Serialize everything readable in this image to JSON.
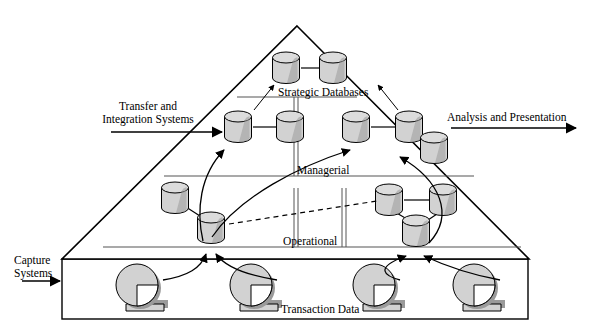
{
  "diagram": {
    "external_labels": {
      "capture_systems": "Capture\nSystems",
      "capture_systems_line1": "Capture",
      "capture_systems_line2": "Systems",
      "transfer_integration_line1": "Transfer and",
      "transfer_integration_line2": "Integration Systems",
      "analysis_presentation": "Analysis and Presentation"
    },
    "tiers": [
      {
        "id": "strategic",
        "label": "Strategic Databases",
        "cylinders": 2
      },
      {
        "id": "managerial",
        "label": "Managerial",
        "cylinders": 5
      },
      {
        "id": "operational",
        "label": "Operational",
        "cylinders": 5
      }
    ],
    "base_box": {
      "label": "Transaction Data",
      "tape_reels": 4
    },
    "colors": {
      "stroke": "#000000",
      "cylinder_fill": "#d2d2d2",
      "cylinder_top": "#dcdcdc",
      "cylinder_shadow": "#8c8c8c",
      "tier_rule": "#555555",
      "background": "#ffffff"
    }
  }
}
